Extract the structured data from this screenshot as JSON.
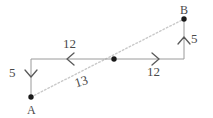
{
  "figure": {
    "colors": {
      "solid_line": "#9a9a9a",
      "dotted_line": "#c9c9c9",
      "dot": "#1a1a1a",
      "text": "#4a4a4a",
      "background": "#ffffff"
    },
    "points": [
      {
        "id": "A",
        "label": "A",
        "x": 31,
        "y": 97
      },
      {
        "id": "M",
        "label": "",
        "x": 114,
        "y": 60
      },
      {
        "id": "B",
        "label": "B",
        "x": 184,
        "y": 19
      }
    ],
    "labels": {
      "point_a": "A",
      "point_b": "B",
      "segment_top": "12",
      "segment_right": "12",
      "vertical_left": "5",
      "vertical_right": "5",
      "diagonal": "13"
    },
    "arrows": {
      "top_segment": "chevron-left",
      "right_segment": "chevron-right",
      "left_vertical": "chevron-down",
      "right_vertical": "chevron-up"
    }
  }
}
